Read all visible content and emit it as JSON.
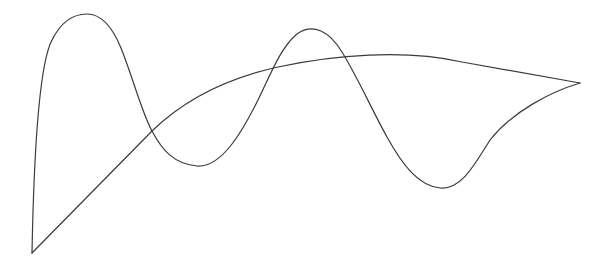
{
  "figure": {
    "width": 607,
    "height": 268,
    "background_color": "#ffffff",
    "stroke_color": "#3a3a3a",
    "stroke_width": 1.2
  },
  "chart_data": {
    "type": "line",
    "title": "",
    "subtitle": "",
    "xlabel": "",
    "ylabel": "",
    "grid": false,
    "legend": null,
    "axes_visible": false,
    "tick_labels_x": [],
    "tick_labels_y": [],
    "xlim": [
      0,
      607
    ],
    "ylim": [
      268,
      0
    ],
    "coordinate_system": "pixel (y increases downward)",
    "series": [
      {
        "name": "upper-oscillating-curve",
        "description": "Sharp start at lower-left, steep rise to first tall peak, descent into a broad valley, rise to a second rounded peak, steep descent to a right valley, then rise to the sharp right vertex.",
        "style": "smooth",
        "key_points": [
          {
            "label": "start-vertex",
            "x": 32,
            "y": 253
          },
          {
            "label": "first-peak",
            "x": 87,
            "y": 14
          },
          {
            "label": "first-crossing",
            "x": 152,
            "y": 131
          },
          {
            "label": "first-valley",
            "x": 197,
            "y": 166
          },
          {
            "label": "second-peak",
            "x": 297,
            "y": 34
          },
          {
            "label": "second-crossing",
            "x": 387,
            "y": 90
          },
          {
            "label": "second-valley",
            "x": 486,
            "y": 185
          },
          {
            "label": "end-vertex",
            "x": 580,
            "y": 83
          }
        ]
      },
      {
        "name": "lower-arc-curve",
        "description": "Nearly straight diagonal from the lower-left vertex climbing up and to the right, bending gently through a shallow arc to a sharp apex, then descending to the right vertex.",
        "style": "gently-curved-polyline",
        "key_points": [
          {
            "label": "start-vertex",
            "x": 32,
            "y": 253
          },
          {
            "label": "first-crossing",
            "x": 152,
            "y": 131
          },
          {
            "label": "mid-rise",
            "x": 300,
            "y": 112
          },
          {
            "label": "second-crossing",
            "x": 387,
            "y": 90
          },
          {
            "label": "apex-vertex",
            "x": 462,
            "y": 62
          },
          {
            "label": "end-vertex",
            "x": 580,
            "y": 83
          }
        ]
      }
    ],
    "intersections": [
      {
        "label": "left-crossing",
        "x": 152,
        "y": 131
      },
      {
        "label": "right-crossing",
        "x": 387,
        "y": 90
      }
    ],
    "corners": [
      {
        "label": "bottom-left-cusp",
        "x": 32,
        "y": 253
      },
      {
        "label": "right-cusp",
        "x": 580,
        "y": 83
      },
      {
        "label": "upper-right-apex",
        "x": 462,
        "y": 62
      }
    ]
  }
}
